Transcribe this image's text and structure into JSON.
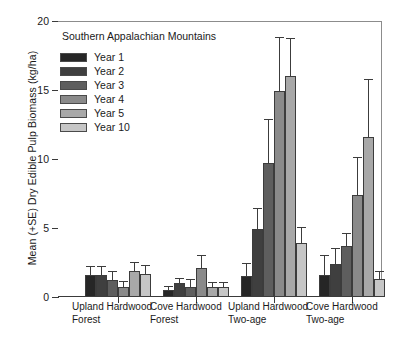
{
  "chart_data": {
    "type": "bar",
    "title": "Southern Appalachian Mountains",
    "xlabel": "",
    "ylabel": "Mean (+SE) Dry Edible Pulp Biomass (kg/ha)",
    "ylim": [
      0,
      20
    ],
    "yticks": [
      0,
      5,
      10,
      15,
      20
    ],
    "ytick_labels": [
      "0",
      "5",
      "10",
      "15",
      "20"
    ],
    "grid": false,
    "legend_position": "upper-left-inside",
    "error_bars": "upper (+SE) only",
    "categories": [
      "Upland Hardwood Forest",
      "Cove Hardwood Forest",
      "Upland Hardwood Two-age",
      "Cove Hardwood Two-age"
    ],
    "category_lines": [
      [
        "Upland Hardwood",
        "Forest"
      ],
      [
        "Cove Hardwood",
        "Forest"
      ],
      [
        "Upland Hardwood",
        "Two-age"
      ],
      [
        "Cove Hardwood",
        "Two-age"
      ]
    ],
    "series": [
      {
        "name": "Year 1",
        "color": "#262626",
        "values": [
          1.6,
          0.5,
          1.5,
          1.6
        ],
        "errors_upper": [
          2.2,
          0.75,
          2.4,
          3.0
        ]
      },
      {
        "name": "Year 2",
        "color": "#3f3f3f",
        "values": [
          1.6,
          1.0,
          4.9,
          2.4
        ],
        "errors_upper": [
          2.2,
          1.3,
          6.4,
          3.5
        ]
      },
      {
        "name": "Year 3",
        "color": "#5e5e5e",
        "values": [
          1.2,
          0.7,
          9.7,
          3.7
        ],
        "errors_upper": [
          1.8,
          1.25,
          12.8,
          4.6
        ]
      },
      {
        "name": "Year 4",
        "color": "#8a8a8a",
        "values": [
          0.7,
          2.1,
          14.9,
          7.4
        ],
        "errors_upper": [
          1.1,
          3.0,
          18.8,
          10.1
        ]
      },
      {
        "name": "Year 5",
        "color": "#a8a8a8",
        "values": [
          1.9,
          0.7,
          16.0,
          11.6
        ],
        "errors_upper": [
          2.5,
          1.05,
          18.7,
          15.7
        ]
      },
      {
        "name": "Year 10",
        "color": "#c6c6c6",
        "values": [
          1.7,
          0.7,
          3.9,
          1.3
        ],
        "errors_upper": [
          2.25,
          1.0,
          5.0,
          1.8
        ]
      }
    ]
  },
  "axis": {
    "y_title": "Mean (+SE) Dry Edible Pulp Biomass (kg/ha)"
  },
  "legend": {
    "items": [
      {
        "label": "Year 1"
      },
      {
        "label": "Year 2"
      },
      {
        "label": "Year 3"
      },
      {
        "label": "Year 4"
      },
      {
        "label": "Year 5"
      },
      {
        "label": "Year 10"
      }
    ]
  }
}
